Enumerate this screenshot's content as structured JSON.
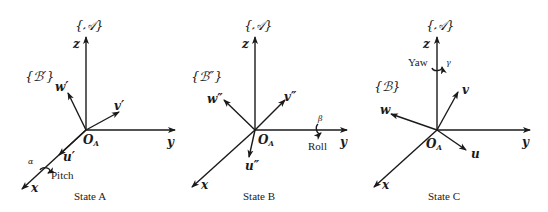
{
  "figure": {
    "panels": [
      {
        "id": "A",
        "caption": "State A",
        "world_frame_label": "{𝒜}",
        "body_frame_label": "{ℬ′}",
        "world_axes": {
          "x": "x",
          "y": "y",
          "z": "z"
        },
        "body_axes": {
          "u": "u′",
          "v": "v′",
          "w": "w′"
        },
        "origin_label": "O",
        "origin_sub": "A",
        "rotation": {
          "name": "Pitch",
          "angle": "α",
          "about": "x"
        }
      },
      {
        "id": "B",
        "caption": "State B",
        "world_frame_label": "{𝒜}",
        "body_frame_label": "{ℬ″}",
        "world_axes": {
          "x": "x",
          "y": "y",
          "z": "z"
        },
        "body_axes": {
          "u": "u″",
          "v": "v″",
          "w": "w″"
        },
        "origin_label": "O",
        "origin_sub": "A",
        "rotation": {
          "name": "Roll",
          "angle": "β",
          "about": "y"
        }
      },
      {
        "id": "C",
        "caption": "State C",
        "world_frame_label": "{𝒜}",
        "body_frame_label": "{ℬ}",
        "world_axes": {
          "x": "x",
          "y": "y",
          "z": "z"
        },
        "body_axes": {
          "u": "u",
          "v": "v",
          "w": "w"
        },
        "origin_label": "O",
        "origin_sub": "A",
        "rotation": {
          "name": "Yaw",
          "angle": "γ",
          "about": "z"
        }
      }
    ]
  }
}
